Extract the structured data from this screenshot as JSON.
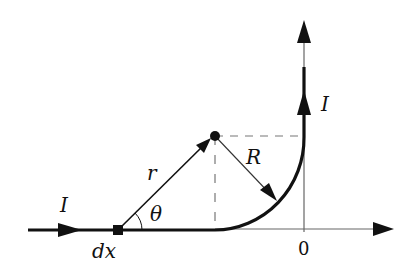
{
  "diagram": {
    "title": "",
    "labels": {
      "current_left": "I",
      "current_right": "I",
      "element": "dx",
      "distance": "r",
      "angle": "θ",
      "radius": "R",
      "origin": "0"
    },
    "colors": {
      "stroke": "#111111",
      "axis": "#555555",
      "dashed": "#777777",
      "background": "#ffffff"
    }
  }
}
